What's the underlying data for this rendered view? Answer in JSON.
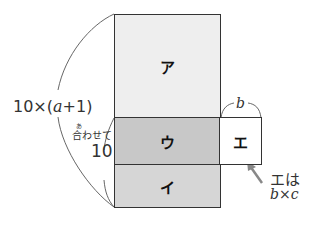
{
  "regions": {
    "a": {
      "label": "ア",
      "color": "#eeeeee"
    },
    "u": {
      "label": "ウ",
      "color": "#c8c8c8"
    },
    "i": {
      "label": "イ",
      "color": "#d6d6d6"
    },
    "e": {
      "label": "エ",
      "color": "#ffffff"
    }
  },
  "labels": {
    "total_prefix": "10×(",
    "total_var": "a",
    "total_suffix": "+1)",
    "ruby": "あ",
    "combined": "合わせて",
    "combined_value": "10",
    "width_var": "b",
    "note_line1": "エは",
    "note_b": "b",
    "note_times": "×",
    "note_c": "c"
  },
  "colors": {
    "outline": "#333333",
    "arrow": "#888888",
    "brace": "#555555"
  }
}
